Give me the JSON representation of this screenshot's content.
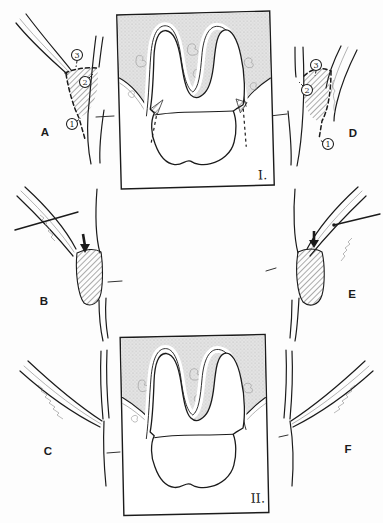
{
  "labels": {
    "panel_a": "A",
    "panel_b": "B",
    "panel_c": "C",
    "panel_d": "D",
    "panel_e": "E",
    "panel_f": "F",
    "image_1": "I.",
    "image_2": "II."
  },
  "markers": {
    "m1": "1",
    "m2": "2",
    "m3": "3"
  },
  "colors": {
    "line": "#1b1b1b",
    "paper": "#fdfdfd",
    "bonefill": "#e4e4e4",
    "bonedot": "#ababab",
    "hatchline": "#2e2e2e",
    "faint": "#8a8a8a"
  }
}
